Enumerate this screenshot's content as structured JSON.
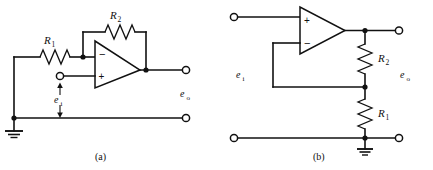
{
  "figure": {
    "background_color": "#ffffff",
    "line_color": "#111111",
    "width": 433,
    "height": 170
  },
  "circuits": [
    {
      "id": "circuit-a",
      "caption": "(a)",
      "type": "inverting-amplifier",
      "components": {
        "resistor_input": {
          "label": "R",
          "subscript": "1",
          "full": "R1",
          "orientation": "horizontal"
        },
        "resistor_feedback": {
          "label": "R",
          "subscript": "2",
          "full": "R2",
          "orientation": "horizontal"
        },
        "opamp": {
          "inverting_sign": "−",
          "noninverting_sign": "+",
          "inverting_position": "top",
          "noninverting_position": "bottom"
        },
        "ground": {
          "name": "ground-symbol"
        }
      },
      "labels": {
        "input_voltage": "e",
        "input_voltage_sub": "i",
        "output_voltage": "e",
        "output_voltage_sub": "o"
      },
      "terminals": {
        "input_terminal": "input-terminal",
        "output_terminal_top": "output-terminal-top",
        "output_terminal_bottom": "output-terminal-bottom"
      }
    },
    {
      "id": "circuit-b",
      "caption": "(b)",
      "type": "noninverting-amplifier",
      "components": {
        "resistor_feedback": {
          "label": "R",
          "subscript": "2",
          "full": "R2",
          "orientation": "vertical"
        },
        "resistor_ground": {
          "label": "R",
          "subscript": "1",
          "full": "R1",
          "orientation": "vertical"
        },
        "opamp": {
          "inverting_sign": "−",
          "noninverting_sign": "+",
          "inverting_position": "bottom",
          "noninverting_position": "top"
        },
        "ground": {
          "name": "ground-symbol"
        }
      },
      "labels": {
        "input_voltage": "e",
        "input_voltage_sub": "i",
        "output_voltage": "e",
        "output_voltage_sub": "o"
      },
      "terminals": {
        "input_terminal_top": "input-terminal-top",
        "input_terminal_bottom": "input-terminal-bottom",
        "output_terminal_top": "output-terminal-top",
        "output_terminal_bottom": "output-terminal-bottom"
      }
    }
  ]
}
